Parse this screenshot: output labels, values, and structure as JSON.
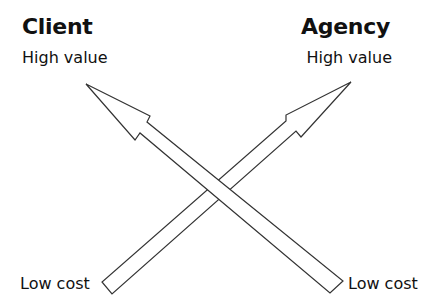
{
  "diagram": {
    "left_party": {
      "title": "Client",
      "top_label": "High value",
      "bottom_label": "Low cost"
    },
    "right_party": {
      "title": "Agency",
      "top_label": "High value",
      "bottom_label": "Low cost"
    },
    "arrows": [
      {
        "name": "client-arrow",
        "from": "bottom-right Low cost",
        "to": "top-left High value"
      },
      {
        "name": "agency-arrow",
        "from": "bottom-left Low cost",
        "to": "top-right High value"
      }
    ],
    "colors": {
      "stroke": "#333333",
      "fill": "#ffffff",
      "text": "#111111"
    }
  }
}
